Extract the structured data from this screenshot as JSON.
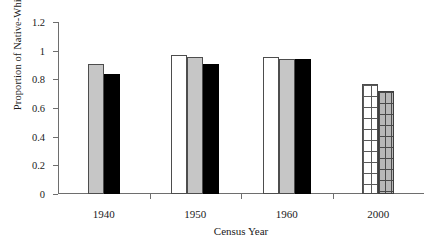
{
  "chart_data": {
    "type": "bar",
    "title": "",
    "xlabel": "Census Year",
    "ylabel": "Proportion of Native-White Wage",
    "categories": [
      "1940",
      "1950",
      "1960",
      "2000"
    ],
    "ylim": [
      0,
      1.2
    ],
    "yticks": [
      "0",
      "0.2",
      "0.4",
      "0.6",
      "0.8",
      "1",
      "1.2"
    ],
    "ytick_values": [
      0,
      0.2,
      0.4,
      0.6,
      0.8,
      1,
      1.2
    ],
    "grid": false,
    "legend": "none",
    "series": [
      {
        "name": "white-bar",
        "fill": "#ffffff",
        "values": [
          null,
          0.97,
          0.955,
          null
        ]
      },
      {
        "name": "gray-bar",
        "fill": "#c6c6c6",
        "values": [
          0.91,
          0.955,
          0.945,
          null
        ]
      },
      {
        "name": "black-bar",
        "fill": "#000000",
        "values": [
          0.84,
          0.91,
          0.94,
          null
        ]
      },
      {
        "name": "white-grid-bar",
        "fill": "#ffffff-grid",
        "values": [
          null,
          null,
          null,
          0.765
        ]
      },
      {
        "name": "gray-grid-bar",
        "fill": "#b8b8b8-grid",
        "values": [
          null,
          null,
          null,
          0.72
        ]
      }
    ],
    "groups": [
      {
        "category": "1940",
        "bars": [
          {
            "style": "gray",
            "value": 0.91
          },
          {
            "style": "black",
            "value": 0.84
          }
        ]
      },
      {
        "category": "1950",
        "bars": [
          {
            "style": "white",
            "value": 0.97
          },
          {
            "style": "gray",
            "value": 0.955
          },
          {
            "style": "black",
            "value": 0.91
          }
        ]
      },
      {
        "category": "1960",
        "bars": [
          {
            "style": "white",
            "value": 0.955
          },
          {
            "style": "gray",
            "value": 0.945
          },
          {
            "style": "black",
            "value": 0.94
          }
        ]
      },
      {
        "category": "2000",
        "bars": [
          {
            "style": "white-grid",
            "value": 0.765
          },
          {
            "style": "gray-grid",
            "value": 0.72
          }
        ]
      }
    ]
  }
}
